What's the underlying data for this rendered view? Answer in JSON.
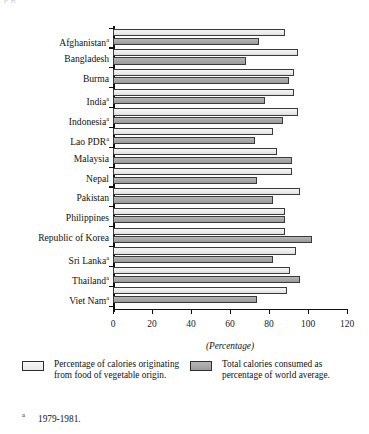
{
  "page": {
    "cropped_header_text": "p g"
  },
  "chart_data": {
    "type": "bar",
    "orientation": "horizontal",
    "title": "",
    "xlabel": "(Percentage)",
    "ylabel": "",
    "xlim": [
      0,
      120
    ],
    "xticks": [
      0,
      20,
      40,
      60,
      80,
      100,
      120
    ],
    "grid": false,
    "legend_position": "below",
    "categories": [
      "Afghanistan",
      "Bangladesh",
      "Burma",
      "India",
      "Indonesia",
      "Lao PDR",
      "Malaysia",
      "Nepal",
      "Pakistan",
      "Philippines",
      "Republic of Korea",
      "Sri Lanka",
      "Thailand",
      "Viet Nam"
    ],
    "category_footnote_marks": [
      "a",
      "",
      "",
      "a",
      "a",
      "a",
      "",
      "",
      "",
      "",
      "",
      "a",
      "a",
      "a"
    ],
    "series": [
      {
        "name": "Percentage of calories originating from food of vegetable origin.",
        "color": "#ececec",
        "values": [
          88,
          95,
          93,
          93,
          95,
          82,
          84,
          92,
          96,
          88,
          88,
          94,
          91,
          89
        ]
      },
      {
        "name": "Total calories consumed as percentage of world average.",
        "color": "#a6a6a6",
        "values": [
          75,
          68,
          90,
          78,
          87,
          73,
          92,
          74,
          82,
          88,
          102,
          82,
          96,
          74
        ]
      }
    ]
  },
  "axis_caption": "(Percentage)",
  "legend": {
    "items": [
      {
        "label": "Percentage of calories originating from food of vegetable origin.",
        "swatch": "light-swatch"
      },
      {
        "label": "Total calories consumed as percentage of world average.",
        "swatch": "dark-swatch"
      }
    ]
  },
  "footnote": {
    "mark": "a",
    "text": "1979-1981."
  }
}
